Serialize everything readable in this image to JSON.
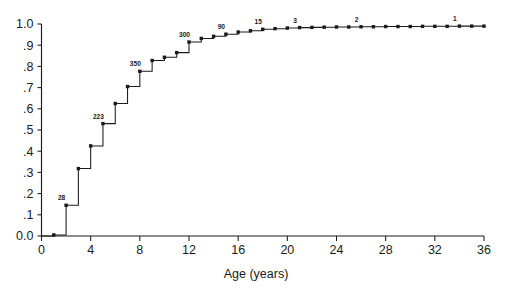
{
  "chart_data": {
    "type": "line",
    "subtype": "step-cumulative",
    "title": "",
    "xlabel": "Age (years)",
    "ylabel": "",
    "xlim": [
      0,
      36
    ],
    "ylim": [
      0.0,
      1.0
    ],
    "grid": false,
    "legend": "none",
    "xticks": [
      0,
      4,
      8,
      12,
      16,
      20,
      24,
      28,
      32,
      36
    ],
    "xtick_labels": [
      "0",
      "4",
      "8",
      "12",
      "16",
      "20",
      "24",
      "28",
      "32",
      "36"
    ],
    "yticks": [
      0.0,
      0.1,
      0.2,
      0.3,
      0.4,
      0.5,
      0.6,
      0.7,
      0.8,
      0.9,
      1.0
    ],
    "ytick_labels": [
      "0.0",
      ".1",
      ".2",
      ".3",
      ".4",
      ".5",
      ".6",
      ".7",
      ".8",
      ".9",
      "1.0"
    ],
    "marker": "square",
    "marker_color": "#1a1a1a",
    "line_color": "#1a1a1a",
    "x": [
      1,
      2,
      3,
      4,
      5,
      6,
      7,
      8,
      9,
      10,
      11,
      12,
      13,
      14,
      15,
      16,
      17,
      18,
      19,
      20,
      21,
      22,
      23,
      24,
      25,
      26,
      27,
      28,
      29,
      30,
      31,
      32,
      33,
      34,
      35,
      36
    ],
    "values": [
      0.005,
      0.145,
      0.318,
      0.425,
      0.53,
      0.625,
      0.705,
      0.777,
      0.828,
      0.843,
      0.865,
      0.915,
      0.932,
      0.942,
      0.952,
      0.962,
      0.968,
      0.975,
      0.978,
      0.981,
      0.983,
      0.984,
      0.985,
      0.986,
      0.986,
      0.987,
      0.987,
      0.988,
      0.988,
      0.988,
      0.989,
      0.989,
      0.989,
      0.99,
      0.99,
      0.99
    ],
    "annotations": [
      {
        "label": "28",
        "x": 2,
        "y": 0.145
      },
      {
        "label": "223",
        "x": 5,
        "y": 0.53
      },
      {
        "label": "350",
        "x": 8,
        "y": 0.777
      },
      {
        "label": "300",
        "x": 12,
        "y": 0.915
      },
      {
        "label": "90",
        "x": 15,
        "y": 0.952
      },
      {
        "label": "15",
        "x": 18,
        "y": 0.975
      },
      {
        "label": "3",
        "x": 21,
        "y": 0.983
      },
      {
        "label": "2",
        "x": 26,
        "y": 0.987
      },
      {
        "label": "1",
        "x": 34,
        "y": 0.99
      }
    ]
  },
  "axes": {
    "x_axis_title": "Age (years)"
  }
}
